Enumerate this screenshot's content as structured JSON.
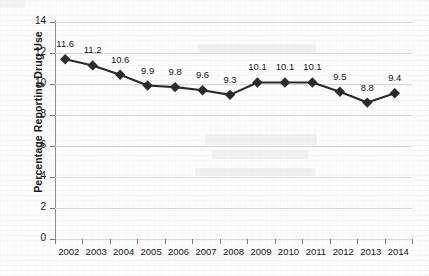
{
  "chart_data": {
    "type": "line",
    "title": "",
    "xlabel": "",
    "ylabel": "Percentage Reporting Drug Use",
    "categories": [
      "2002",
      "2003",
      "2004",
      "2005",
      "2006",
      "2007",
      "2008",
      "2009",
      "2010",
      "2011",
      "2012",
      "2013",
      "2014"
    ],
    "values": [
      11.6,
      11.2,
      10.6,
      9.9,
      9.8,
      9.6,
      9.3,
      10.1,
      10.1,
      10.1,
      9.5,
      8.8,
      9.4
    ],
    "point_labels": [
      "11.6",
      "11.2",
      "10.6",
      "9.9",
      "9.8",
      "9.6",
      "9.3",
      "10.1",
      "10.1",
      "10.1",
      "9.5",
      "8.8",
      "9.4"
    ],
    "ylim": [
      0,
      14
    ],
    "ytick_values": [
      0,
      2,
      4,
      6,
      8,
      10,
      12,
      14
    ],
    "ytick_labels": [
      "0",
      "2",
      "4",
      "6",
      "8",
      "10",
      "12",
      "14"
    ],
    "grid": "horizontal",
    "legend": "none",
    "marker": "diamond",
    "series_color": "#2b2b2b",
    "grid_color": "#d8d8dc",
    "axis_color": "#8d8d90",
    "text_color": "#171717"
  }
}
